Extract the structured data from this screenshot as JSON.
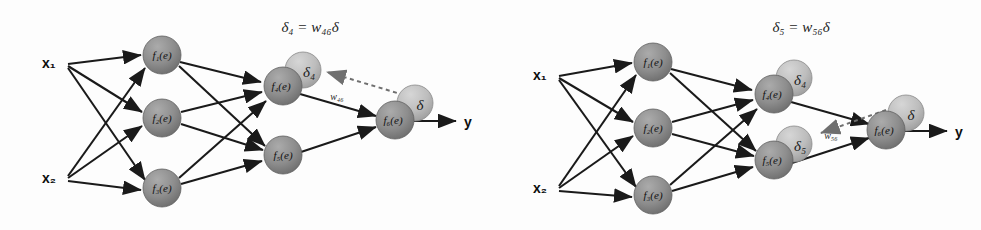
{
  "figure": {
    "background_color": "#fdfdfd",
    "edge_color": "#1a1a1a",
    "node_fill": "#8a8a8a",
    "node_highlight": "#a9a9a9",
    "delta_fill": "#b8b8b8",
    "delta_highlight": "#cfcfcf",
    "dotted_arrow_color": "#6b6b6b"
  },
  "panels": [
    {
      "id": "left",
      "formula": {
        "lhs": "δ",
        "lhs_sub": "4",
        "eq": "=",
        "w": "w",
        "w_sub": "46",
        "rhs": "δ",
        "text": "δ₄ = w₄₆δ"
      },
      "inputs": [
        {
          "name": "x",
          "sub": "1",
          "text": "x₁",
          "cx": 52,
          "cy": 62
        },
        {
          "name": "x",
          "sub": "2",
          "text": "x₂",
          "cx": 52,
          "cy": 178
        }
      ],
      "nodes": [
        {
          "id": "f1",
          "label": "f",
          "sub": "1",
          "arg": "(e)",
          "text": "f₁(e)",
          "cx": 162,
          "cy": 55,
          "r": 19,
          "delta": null
        },
        {
          "id": "f2",
          "label": "f",
          "sub": "2",
          "arg": "(e)",
          "text": "f₂(e)",
          "cx": 162,
          "cy": 118,
          "r": 19,
          "delta": null
        },
        {
          "id": "f3",
          "label": "f",
          "sub": "3",
          "arg": "(e)",
          "text": "f₃(e)",
          "cx": 162,
          "cy": 188,
          "r": 19,
          "delta": null
        },
        {
          "id": "f4",
          "label": "f",
          "sub": "4",
          "arg": "(e)",
          "text": "f₄(e)",
          "cx": 283,
          "cy": 86,
          "r": 19,
          "delta": {
            "text": "δ₄",
            "sym": "δ",
            "sub": "4",
            "cx": 303,
            "cy": 70,
            "r": 18
          }
        },
        {
          "id": "f5",
          "label": "f",
          "sub": "5",
          "arg": "(e)",
          "text": "f₅(e)",
          "cx": 283,
          "cy": 155,
          "r": 19,
          "delta": null
        },
        {
          "id": "f6",
          "label": "f",
          "sub": "6",
          "arg": "(e)",
          "text": "f₆(e)",
          "cx": 395,
          "cy": 120,
          "r": 19,
          "delta": {
            "text": "δ",
            "sym": "δ",
            "sub": "",
            "cx": 415,
            "cy": 103,
            "r": 18
          }
        }
      ],
      "weight_label": {
        "text": "w₄₆",
        "sym": "w",
        "sub": "46",
        "x": 337,
        "y": 97
      },
      "output": {
        "text": "y",
        "x": 470,
        "y": 125
      },
      "edges": [
        [
          "x1",
          "f1"
        ],
        [
          "x1",
          "f2"
        ],
        [
          "x1",
          "f3"
        ],
        [
          "x2",
          "f1"
        ],
        [
          "x2",
          "f2"
        ],
        [
          "x2",
          "f3"
        ],
        [
          "f1",
          "f4"
        ],
        [
          "f1",
          "f5"
        ],
        [
          "f2",
          "f4"
        ],
        [
          "f2",
          "f5"
        ],
        [
          "f3",
          "f4"
        ],
        [
          "f3",
          "f5"
        ],
        [
          "f4",
          "f6"
        ],
        [
          "f5",
          "f6"
        ]
      ],
      "back_edge": {
        "from": "f6-delta",
        "to": "f4-delta",
        "style": "dotted"
      }
    },
    {
      "id": "right",
      "formula": {
        "lhs": "δ",
        "lhs_sub": "5",
        "eq": "=",
        "w": "w",
        "w_sub": "56",
        "rhs": "δ",
        "text": "δ₅ = w₅₆δ"
      },
      "inputs": [
        {
          "name": "x",
          "sub": "1",
          "text": "x₁",
          "cx": 52,
          "cy": 75
        },
        {
          "name": "x",
          "sub": "2",
          "text": "x₂",
          "cx": 52,
          "cy": 188
        }
      ],
      "nodes": [
        {
          "id": "f1",
          "label": "f",
          "sub": "1",
          "arg": "(e)",
          "text": "f₁(e)",
          "cx": 162,
          "cy": 62,
          "r": 19,
          "delta": null
        },
        {
          "id": "f2",
          "label": "f",
          "sub": "2",
          "arg": "(e)",
          "text": "f₂(e)",
          "cx": 162,
          "cy": 128,
          "r": 19,
          "delta": null
        },
        {
          "id": "f3",
          "label": "f",
          "sub": "3",
          "arg": "(e)",
          "text": "f₃(e)",
          "cx": 162,
          "cy": 195,
          "r": 19,
          "delta": null
        },
        {
          "id": "f4",
          "label": "f",
          "sub": "4",
          "arg": "(e)",
          "text": "f₄(e)",
          "cx": 283,
          "cy": 94,
          "r": 19,
          "delta": {
            "text": "δ₄",
            "sym": "δ",
            "sub": "4",
            "cx": 303,
            "cy": 78,
            "r": 18
          }
        },
        {
          "id": "f5",
          "label": "f",
          "sub": "5",
          "arg": "(e)",
          "text": "f₅(e)",
          "cx": 283,
          "cy": 160,
          "r": 19,
          "delta": {
            "text": "δ₅",
            "sym": "δ",
            "sub": "5",
            "cx": 303,
            "cy": 144,
            "r": 18
          }
        },
        {
          "id": "f6",
          "label": "f",
          "sub": "6",
          "arg": "(e)",
          "text": "f₆(e)",
          "cx": 395,
          "cy": 130,
          "r": 19,
          "delta": {
            "text": "δ",
            "sym": "δ",
            "sub": "",
            "cx": 415,
            "cy": 113,
            "r": 18
          }
        }
      ],
      "weight_label": {
        "text": "w₅₆",
        "sym": "w",
        "sub": "56",
        "x": 338,
        "y": 135
      },
      "output": {
        "text": "y",
        "x": 470,
        "y": 134
      },
      "edges": [
        [
          "x1",
          "f1"
        ],
        [
          "x1",
          "f2"
        ],
        [
          "x1",
          "f3"
        ],
        [
          "x2",
          "f1"
        ],
        [
          "x2",
          "f2"
        ],
        [
          "x2",
          "f3"
        ],
        [
          "f1",
          "f4"
        ],
        [
          "f1",
          "f5"
        ],
        [
          "f2",
          "f4"
        ],
        [
          "f2",
          "f5"
        ],
        [
          "f3",
          "f4"
        ],
        [
          "f3",
          "f5"
        ],
        [
          "f4",
          "f6"
        ],
        [
          "f5",
          "f6"
        ]
      ],
      "back_edge": {
        "from": "f6-delta",
        "to": "f5-delta",
        "style": "dotted"
      }
    }
  ]
}
